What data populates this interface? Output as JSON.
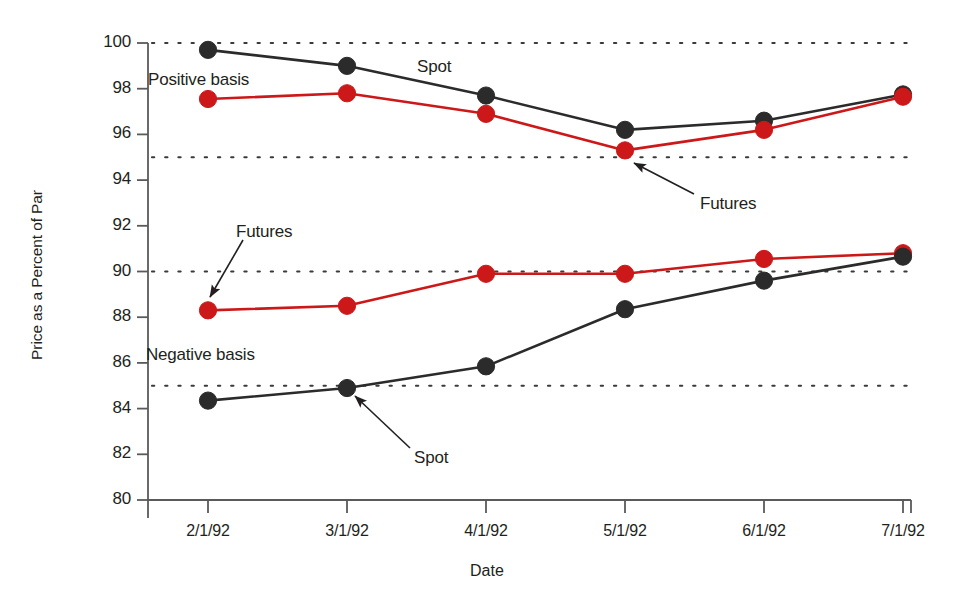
{
  "chart_data": {
    "type": "line",
    "title": "",
    "xlabel": "Date",
    "ylabel": "Price as a Percent of Par",
    "categories": [
      "2/1/92",
      "3/1/92",
      "4/1/92",
      "5/1/92",
      "6/1/92",
      "7/1/92"
    ],
    "ylim": [
      80,
      100
    ],
    "xlim_index": [
      0,
      5
    ],
    "y_ticks": [
      80,
      82,
      84,
      86,
      88,
      90,
      92,
      94,
      96,
      98,
      100
    ],
    "y_tick_labels": [
      "80",
      "82",
      "84",
      "86",
      "88",
      "90",
      "92",
      "94",
      "96",
      "98",
      "100"
    ],
    "gridlines_y": [
      85,
      90,
      95,
      100
    ],
    "grid": "horizontal-dotted",
    "legend": "none",
    "series": [
      {
        "name": "Spot (positive basis)",
        "group": "Positive basis",
        "color": "#2b2b2b",
        "values": [
          99.7,
          99.0,
          97.7,
          96.2,
          96.6,
          97.75
        ]
      },
      {
        "name": "Futures (positive basis)",
        "group": "Positive basis",
        "color": "#cc1818",
        "values": [
          97.55,
          97.8,
          96.9,
          95.3,
          96.2,
          97.65
        ]
      },
      {
        "name": "Futures (negative basis)",
        "group": "Negative basis",
        "color": "#cc1818",
        "values": [
          88.3,
          88.5,
          89.9,
          89.9,
          90.55,
          90.8
        ]
      },
      {
        "name": "Spot (negative basis)",
        "group": "Negative basis",
        "color": "#2b2b2b",
        "values": [
          84.35,
          84.9,
          85.85,
          88.35,
          89.6,
          90.65
        ]
      }
    ],
    "annotations": [
      {
        "id": "positive-basis",
        "text": "Positive basis",
        "x_px": 148,
        "y_px": 70,
        "arrow": false
      },
      {
        "id": "negative-basis",
        "text": "Negative basis",
        "x_px": 146,
        "y_px": 345,
        "arrow": false
      },
      {
        "id": "spot-upper",
        "text": "Spot",
        "x_px": 417,
        "y_px": 57,
        "arrow": false
      },
      {
        "id": "futures-upper",
        "text": "Futures",
        "x_px": 700,
        "y_px": 194,
        "arrow": true,
        "arrow_from_x": 694,
        "arrow_from_y": 194,
        "arrow_to_x": 634,
        "arrow_to_y": 163
      },
      {
        "id": "futures-lower",
        "text": "Futures",
        "x_px": 236,
        "y_px": 222,
        "arrow": true,
        "arrow_from_x": 243,
        "arrow_from_y": 240,
        "arrow_to_x": 210,
        "arrow_to_y": 297
      },
      {
        "id": "spot-lower",
        "text": "Spot",
        "x_px": 414,
        "y_px": 448,
        "arrow": true,
        "arrow_from_x": 410,
        "arrow_from_y": 448,
        "arrow_to_x": 355,
        "arrow_to_y": 396
      }
    ]
  },
  "axis": {
    "x_title": "Date",
    "y_title": "Price as a Percent of Par"
  },
  "style": {
    "spot_color": "#2b2b2b",
    "futures_color": "#cc1818",
    "axis_color": "#5a5a5a",
    "grid_color": "#3a3a3a",
    "background": "#ffffff"
  }
}
